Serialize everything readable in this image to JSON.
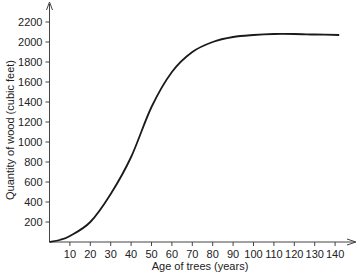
{
  "chart_data": {
    "type": "line",
    "title": "",
    "xlabel": "Age of trees (years)",
    "ylabel": "Quantity of wood (cubic feet)",
    "xlim": [
      0,
      145
    ],
    "ylim": [
      0,
      2300
    ],
    "x_ticks": [
      10,
      20,
      30,
      40,
      50,
      60,
      70,
      80,
      90,
      100,
      110,
      120,
      130,
      140
    ],
    "y_ticks": [
      200,
      400,
      600,
      800,
      1000,
      1200,
      1400,
      1600,
      1800,
      2000,
      2200
    ],
    "grid": false,
    "series": [
      {
        "name": "Wood quantity",
        "x": [
          0,
          5,
          10,
          20,
          30,
          40,
          50,
          60,
          70,
          80,
          90,
          100,
          110,
          120,
          130,
          142
        ],
        "y": [
          0,
          20,
          60,
          200,
          480,
          850,
          1350,
          1700,
          1900,
          2000,
          2050,
          2070,
          2080,
          2080,
          2075,
          2070
        ]
      }
    ]
  }
}
